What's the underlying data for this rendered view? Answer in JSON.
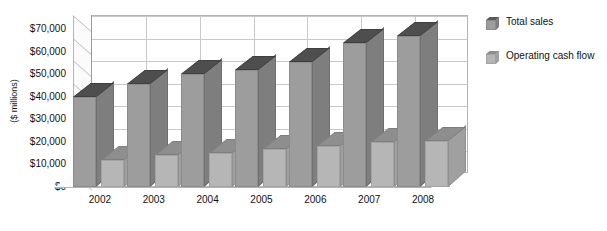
{
  "chart_data": {
    "type": "bar",
    "title": "",
    "subtitle": "",
    "xlabel": "",
    "ylabel": "($ millions)",
    "categories": [
      "2002",
      "2003",
      "2004",
      "2005",
      "2006",
      "2007",
      "2008"
    ],
    "series": [
      {
        "name": "Total sales",
        "values": [
          40000,
          45500,
          50000,
          52000,
          55500,
          64000,
          67000
        ],
        "color": "#9d9d9d"
      },
      {
        "name": "Operating cash flow",
        "values": [
          12000,
          14000,
          15000,
          17000,
          18000,
          20000,
          20500
        ],
        "color": "#b6b6b6"
      }
    ],
    "ylim": [
      0,
      70000
    ],
    "ytick_values": [
      0,
      10000,
      20000,
      30000,
      40000,
      50000,
      60000,
      70000
    ],
    "ytick_labels": [
      "$0",
      "$10,000",
      "$20,000",
      "$30,000",
      "$40,000",
      "$50,000",
      "$60,000",
      "$70,000"
    ],
    "grid": true,
    "legend_position": "right",
    "three_d": true
  },
  "legend": {
    "items": [
      {
        "label": "Total sales",
        "swatch": "series-1-swatch"
      },
      {
        "label": "Operating cash flow",
        "swatch": "series-2-swatch"
      }
    ]
  },
  "axes": {
    "y_title": "($ millions)"
  }
}
